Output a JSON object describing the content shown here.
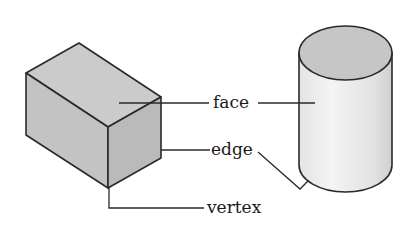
{
  "diagram": {
    "shapes": [
      {
        "name": "rectangular-prism",
        "type": "box"
      },
      {
        "name": "cylinder",
        "type": "cylinder"
      }
    ],
    "labels": {
      "face": "face",
      "edge": "edge",
      "vertex": "vertex"
    },
    "colors": {
      "outline": "#2a2a2a",
      "box_top": "#c9c9c9",
      "box_left": "#c2c2c2",
      "box_right": "#b8b8b8",
      "cylinder_top": "#c6c6c6",
      "cylinder_side": "#ededed",
      "background": "#ffffff"
    }
  }
}
